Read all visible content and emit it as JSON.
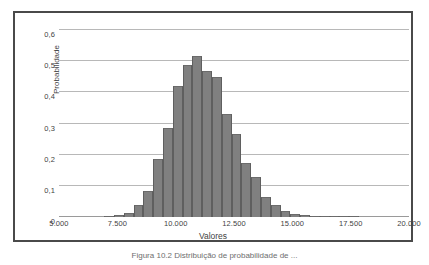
{
  "figure": {
    "caption": "Figura 10.2  Distribuição de probabilidade de ...",
    "frame_color": "#4a4a4a"
  },
  "chart_data": {
    "type": "bar",
    "title": "",
    "xlabel": "Valores",
    "ylabel": "Probabilidade",
    "xlim": [
      5000,
      20000
    ],
    "ylim": [
      0,
      0.6
    ],
    "grid": true,
    "legend": "none",
    "bar_color": "#808080",
    "bar_edge_color": "#5f5f5f",
    "gridline_color": "#b8b8b8",
    "y_ticks": [
      0,
      0.1,
      0.2,
      0.3,
      0.4,
      0.5,
      0.6
    ],
    "y_tick_labels": [
      "0",
      "0,1",
      "0,2",
      "0,3",
      "0,4",
      "0,5",
      "0,6"
    ],
    "x_ticks": [
      5000,
      7500,
      10000,
      12500,
      15000,
      17500,
      20000
    ],
    "x_tick_labels": [
      "5.000",
      "7.500",
      "10.000",
      "12.500",
      "15.000",
      "17.500",
      "20.000"
    ],
    "bin_width": 420,
    "categories": [
      7150,
      7570,
      7990,
      8410,
      8830,
      9250,
      9670,
      10090,
      10510,
      10930,
      11350,
      11770,
      12190,
      12610,
      13030,
      13450,
      13870,
      14290,
      14710,
      15130,
      15550,
      15970,
      16390,
      16810,
      17230,
      17650
    ],
    "values": [
      0.004,
      0.008,
      0.012,
      0.038,
      0.085,
      0.185,
      0.285,
      0.42,
      0.488,
      0.518,
      0.468,
      0.45,
      0.332,
      0.266,
      0.172,
      0.127,
      0.065,
      0.04,
      0.02,
      0.01,
      0.006,
      0.004,
      0.003,
      0.002,
      0.002,
      0.001
    ]
  }
}
